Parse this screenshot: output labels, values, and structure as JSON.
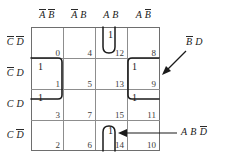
{
  "figure": {
    "type": "karnaugh-map",
    "variables": [
      "A",
      "B",
      "C",
      "D"
    ],
    "size": "4x4"
  },
  "column_headers": [
    {
      "id": "col-0",
      "text": "A̅B̅",
      "parts": [
        {
          "t": "A",
          "bar": true
        },
        {
          "t": "B",
          "bar": true
        }
      ]
    },
    {
      "id": "col-1",
      "text": "A̅B",
      "parts": [
        {
          "t": "A",
          "bar": true
        },
        {
          "t": "B",
          "bar": false
        }
      ]
    },
    {
      "id": "col-2",
      "text": "A B",
      "parts": [
        {
          "t": "A",
          "bar": false
        },
        {
          "t": "B",
          "bar": false
        }
      ]
    },
    {
      "id": "col-3",
      "text": "A B̅",
      "parts": [
        {
          "t": "A",
          "bar": false
        },
        {
          "t": "B",
          "bar": true
        }
      ]
    }
  ],
  "row_headers": [
    {
      "id": "row-0",
      "text": "C̅D̅",
      "parts": [
        {
          "t": "C",
          "bar": true
        },
        {
          "t": "D",
          "bar": true
        }
      ]
    },
    {
      "id": "row-1",
      "text": "C̅D",
      "parts": [
        {
          "t": "C",
          "bar": true
        },
        {
          "t": "D",
          "bar": false
        }
      ]
    },
    {
      "id": "row-2",
      "text": "C D",
      "parts": [
        {
          "t": "C",
          "bar": false
        },
        {
          "t": "D",
          "bar": false
        }
      ]
    },
    {
      "id": "row-3",
      "text": "C D̅",
      "parts": [
        {
          "t": "C",
          "bar": false
        },
        {
          "t": "D",
          "bar": true
        }
      ]
    }
  ],
  "cells": [
    {
      "r": 0,
      "c": 0,
      "index": "0",
      "value": ""
    },
    {
      "r": 0,
      "c": 1,
      "index": "4",
      "value": ""
    },
    {
      "r": 0,
      "c": 2,
      "index": "12",
      "value": "1"
    },
    {
      "r": 0,
      "c": 3,
      "index": "8",
      "value": ""
    },
    {
      "r": 1,
      "c": 0,
      "index": "1",
      "value": "1"
    },
    {
      "r": 1,
      "c": 1,
      "index": "5",
      "value": ""
    },
    {
      "r": 1,
      "c": 2,
      "index": "13",
      "value": ""
    },
    {
      "r": 1,
      "c": 3,
      "index": "9",
      "value": "1"
    },
    {
      "r": 2,
      "c": 0,
      "index": "3",
      "value": "1"
    },
    {
      "r": 2,
      "c": 1,
      "index": "7",
      "value": ""
    },
    {
      "r": 2,
      "c": 2,
      "index": "15",
      "value": ""
    },
    {
      "r": 2,
      "c": 3,
      "index": "11",
      "value": "1"
    },
    {
      "r": 3,
      "c": 0,
      "index": "2",
      "value": ""
    },
    {
      "r": 3,
      "c": 1,
      "index": "6",
      "value": ""
    },
    {
      "r": 3,
      "c": 2,
      "index": "14",
      "value": "1"
    },
    {
      "r": 3,
      "c": 3,
      "index": "10",
      "value": ""
    }
  ],
  "groups": [
    {
      "id": "group-left",
      "shape": "vertical-rounded-rect",
      "cells": [
        "1",
        "3"
      ],
      "label": ""
    },
    {
      "id": "group-right",
      "shape": "vertical-rounded-rect",
      "cells": [
        "9",
        "11"
      ],
      "label": "B̅D"
    },
    {
      "id": "group-cell12",
      "shape": "u-loop-open-top",
      "cells": [
        "12"
      ],
      "label": ""
    },
    {
      "id": "group-cell14",
      "shape": "u-loop-open-bottom",
      "cells": [
        "14"
      ],
      "label": "ABD̅"
    }
  ],
  "annotations": [
    {
      "id": "annot-bd",
      "text": "B̅D",
      "parts": [
        {
          "t": "B",
          "bar": true
        },
        {
          "t": "D",
          "bar": false
        }
      ],
      "points_to": "group-right"
    },
    {
      "id": "annot-abd",
      "text": "A B D̅",
      "parts": [
        {
          "t": "A",
          "bar": false
        },
        {
          "t": "B",
          "bar": false
        },
        {
          "t": "D",
          "bar": true
        }
      ],
      "points_to": "group-cell14"
    }
  ],
  "colors": {
    "ink": "#1a1a1a",
    "grid_line": "#8d8d8d",
    "grid_outer": "#6e6e6e",
    "loop": "#1a1a1a",
    "index_text": "#3b3b3b",
    "background": "#ffffff"
  }
}
